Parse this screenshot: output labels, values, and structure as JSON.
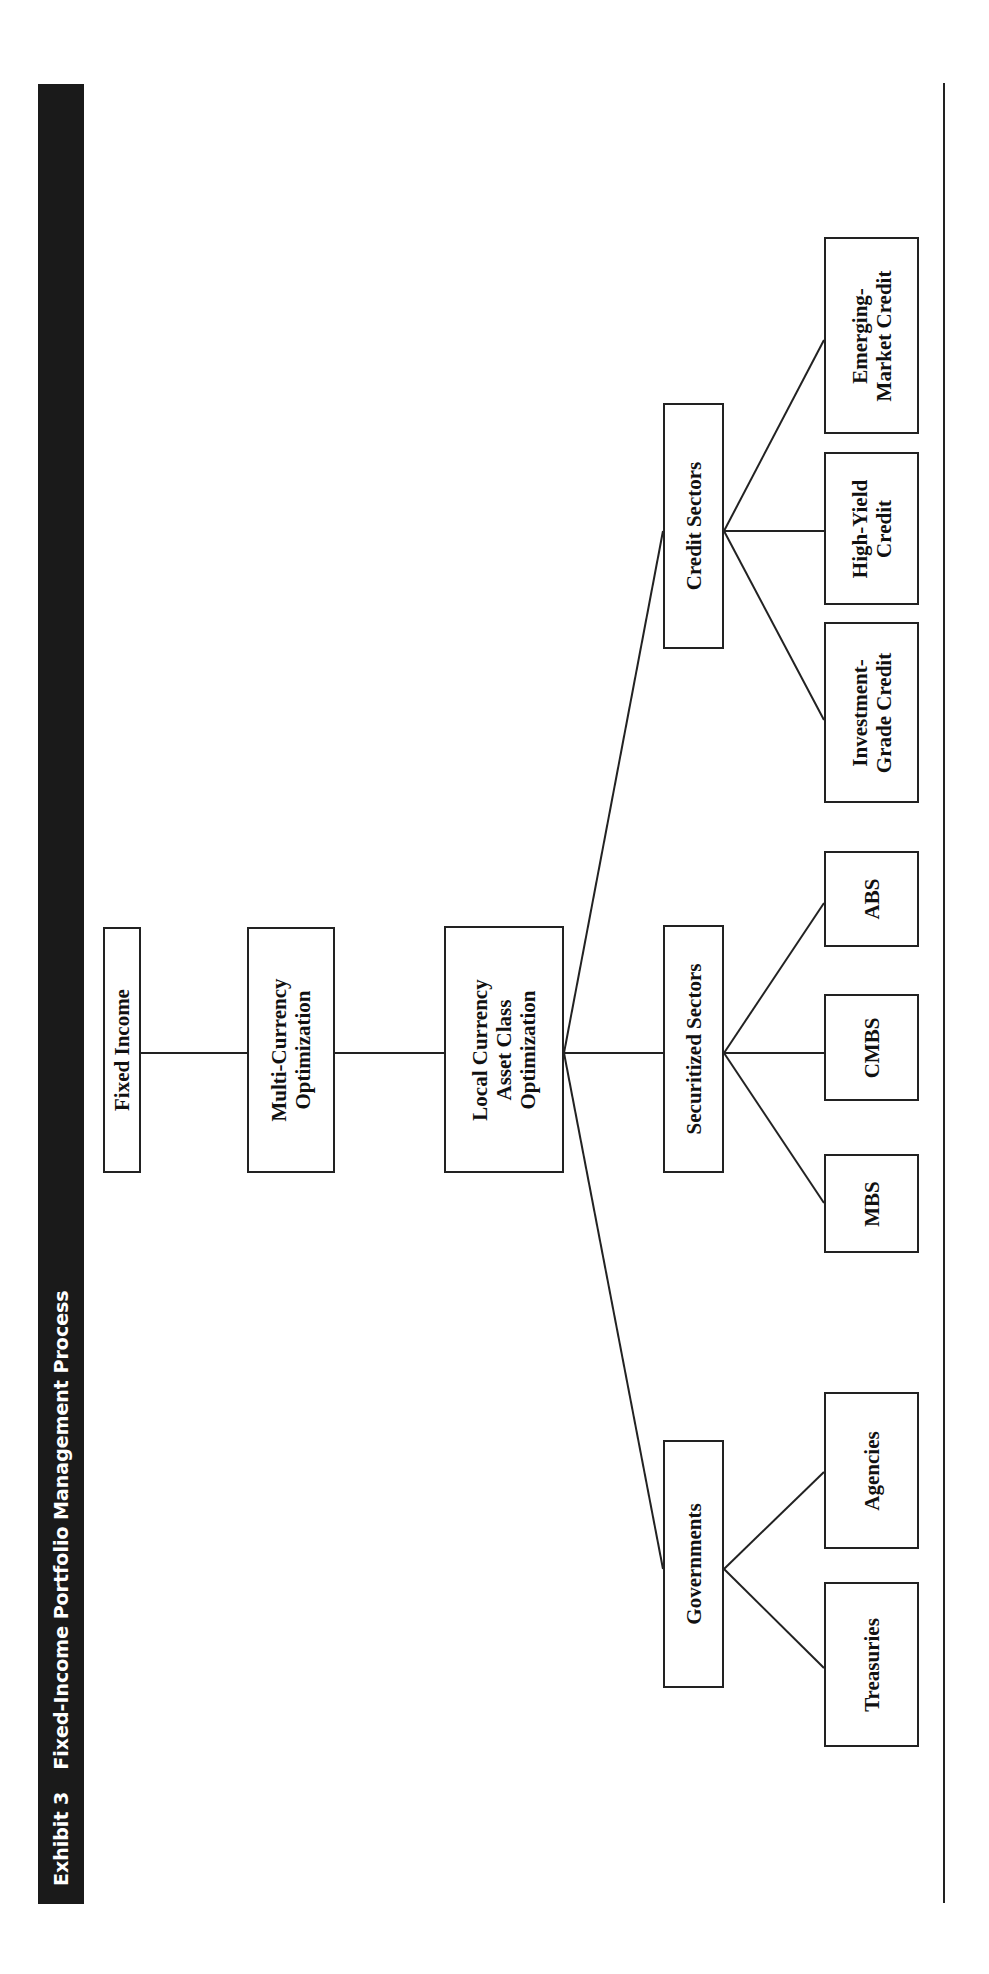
{
  "header": {
    "exhibit": "Exhibit 3",
    "title": "Fixed-Income Portfolio Management Process"
  },
  "colors": {
    "header_bg": "#1a1a1a",
    "header_text": "#ffffff",
    "line": "#222222"
  },
  "nodes": {
    "fixed_income": "Fixed Income",
    "multi_currency": "Multi-Currency\nOptimization",
    "local_currency": "Local Currency\nAsset Class\nOptimization",
    "governments": "Governments",
    "securitized": "Securitized Sectors",
    "credit": "Credit Sectors",
    "treasuries": "Treasuries",
    "agencies": "Agencies",
    "mbs": "MBS",
    "cmbs": "CMBS",
    "abs": "ABS",
    "investment_grade": "Investment-\nGrade Credit",
    "high_yield": "High-Yield\nCredit",
    "emerging_market": "Emerging-\nMarket Credit"
  },
  "hierarchy": {
    "root": "Fixed Income",
    "children": [
      {
        "label": "Multi-Currency Optimization",
        "children": [
          {
            "label": "Local Currency Asset Class Optimization",
            "children": [
              {
                "label": "Governments",
                "children": [
                  "Treasuries",
                  "Agencies"
                ]
              },
              {
                "label": "Securitized Sectors",
                "children": [
                  "MBS",
                  "CMBS",
                  "ABS"
                ]
              },
              {
                "label": "Credit Sectors",
                "children": [
                  "Investment-Grade Credit",
                  "High-Yield Credit",
                  "Emerging-Market Credit"
                ]
              }
            ]
          }
        ]
      }
    ]
  }
}
